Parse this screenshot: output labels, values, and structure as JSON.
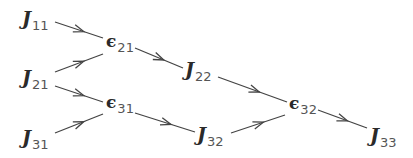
{
  "nodes": [
    {
      "id": "J11",
      "symbol": "J",
      "subscript": "11",
      "kind": "J",
      "x": 22,
      "y": 9
    },
    {
      "id": "e21",
      "symbol": "ϵ",
      "subscript": "21",
      "kind": "eps",
      "x": 106,
      "y": 33
    },
    {
      "id": "J21",
      "symbol": "J",
      "subscript": "21",
      "kind": "J",
      "x": 22,
      "y": 68
    },
    {
      "id": "J22",
      "symbol": "J",
      "subscript": "22",
      "kind": "J",
      "x": 185,
      "y": 60
    },
    {
      "id": "e31",
      "symbol": "ϵ",
      "subscript": "31",
      "kind": "eps",
      "x": 106,
      "y": 94
    },
    {
      "id": "J31",
      "symbol": "J",
      "subscript": "31",
      "kind": "J",
      "x": 22,
      "y": 128
    },
    {
      "id": "J32",
      "symbol": "J",
      "subscript": "32",
      "kind": "J",
      "x": 197,
      "y": 125
    },
    {
      "id": "e32",
      "symbol": "ϵ",
      "subscript": "32",
      "kind": "eps",
      "x": 289,
      "y": 95
    },
    {
      "id": "J33",
      "symbol": "J",
      "subscript": "33",
      "kind": "J",
      "x": 370,
      "y": 126
    }
  ],
  "edges": [
    {
      "from": "J11",
      "to": "e21",
      "x1": 55,
      "y1": 22,
      "x2": 103,
      "y2": 38
    },
    {
      "from": "J21",
      "to": "e21",
      "x1": 55,
      "y1": 72,
      "x2": 103,
      "y2": 54
    },
    {
      "from": "e21",
      "to": "J22",
      "x1": 135,
      "y1": 48,
      "x2": 183,
      "y2": 68
    },
    {
      "from": "J21",
      "to": "e31",
      "x1": 55,
      "y1": 86,
      "x2": 103,
      "y2": 102
    },
    {
      "from": "J31",
      "to": "e31",
      "x1": 55,
      "y1": 133,
      "x2": 103,
      "y2": 114
    },
    {
      "from": "e31",
      "to": "J32",
      "x1": 135,
      "y1": 113,
      "x2": 195,
      "y2": 132
    },
    {
      "from": "J22",
      "to": "e32",
      "x1": 218,
      "y1": 77,
      "x2": 287,
      "y2": 102
    },
    {
      "from": "J32",
      "to": "e32",
      "x1": 231,
      "y1": 133,
      "x2": 285,
      "y2": 115
    },
    {
      "from": "e32",
      "to": "J33",
      "x1": 318,
      "y1": 110,
      "x2": 367,
      "y2": 128
    }
  ],
  "colors": {
    "stroke": "#444444",
    "text": "#2a2a2a",
    "background": "#ffffff"
  }
}
